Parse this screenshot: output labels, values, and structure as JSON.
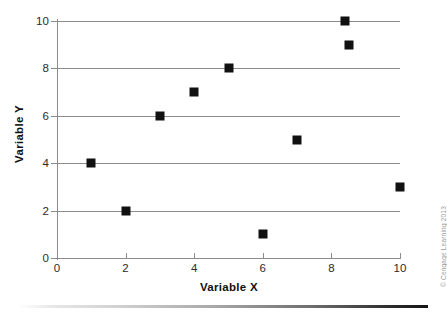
{
  "chart_data": {
    "type": "scatter",
    "title": "",
    "xlabel": "Variable X",
    "ylabel": "Variable Y",
    "xlim": [
      0,
      10
    ],
    "ylim": [
      0,
      10
    ],
    "xticks": [
      "0",
      "2",
      "4",
      "6",
      "8",
      "10"
    ],
    "yticks": [
      "0",
      "2",
      "4",
      "6",
      "8",
      "10"
    ],
    "xtick_values": [
      0,
      2,
      4,
      6,
      8,
      10
    ],
    "ytick_values": [
      0,
      2,
      4,
      6,
      8,
      10
    ],
    "grid": "horizontal",
    "gridline_values": [
      2,
      4,
      6,
      8,
      10
    ],
    "legend": "none",
    "marker": "square",
    "marker_color": "#111111",
    "gridline_color": "#8c8c8c",
    "background_color": "#ffffff",
    "points": [
      {
        "x": 1,
        "y": 4
      },
      {
        "x": 2,
        "y": 2
      },
      {
        "x": 3,
        "y": 6
      },
      {
        "x": 4,
        "y": 7
      },
      {
        "x": 5,
        "y": 8
      },
      {
        "x": 6,
        "y": 1
      },
      {
        "x": 7,
        "y": 5
      },
      {
        "x": 8.4,
        "y": 10
      },
      {
        "x": 8.5,
        "y": 9
      },
      {
        "x": 10,
        "y": 3
      }
    ]
  },
  "credit": {
    "text": "© Cengage Learning 2013"
  }
}
